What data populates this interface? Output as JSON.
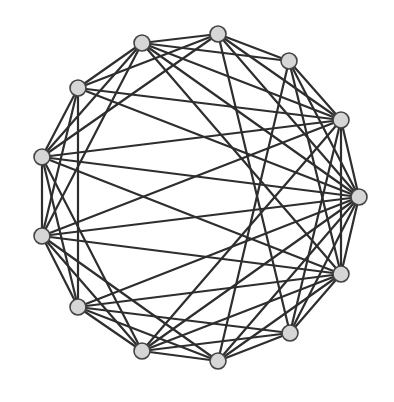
{
  "diagram": {
    "type": "graph",
    "layout": "circular",
    "node_count": 13,
    "colors": {
      "edge": "#2e2e2e",
      "node_fill": "#d6d6d6",
      "node_stroke": "#444444",
      "background": "#ffffff"
    },
    "node_radius": 8,
    "nodes": [
      {
        "id": 0,
        "x": 218,
        "y": 34
      },
      {
        "id": 1,
        "x": 289,
        "y": 61
      },
      {
        "id": 2,
        "x": 341,
        "y": 120
      },
      {
        "id": 3,
        "x": 359,
        "y": 197
      },
      {
        "id": 4,
        "x": 341,
        "y": 274
      },
      {
        "id": 5,
        "x": 290,
        "y": 333
      },
      {
        "id": 6,
        "x": 218,
        "y": 361
      },
      {
        "id": 7,
        "x": 142,
        "y": 351
      },
      {
        "id": 8,
        "x": 78,
        "y": 307
      },
      {
        "id": 9,
        "x": 42,
        "y": 236
      },
      {
        "id": 10,
        "x": 42,
        "y": 157
      },
      {
        "id": 11,
        "x": 78,
        "y": 88
      },
      {
        "id": 12,
        "x": 142,
        "y": 43
      }
    ],
    "edges": [
      [
        0,
        1
      ],
      [
        1,
        2
      ],
      [
        2,
        3
      ],
      [
        3,
        4
      ],
      [
        4,
        5
      ],
      [
        5,
        6
      ],
      [
        6,
        7
      ],
      [
        7,
        8
      ],
      [
        8,
        9
      ],
      [
        9,
        10
      ],
      [
        10,
        11
      ],
      [
        11,
        12
      ],
      [
        12,
        0
      ],
      [
        0,
        2
      ],
      [
        1,
        3
      ],
      [
        2,
        4
      ],
      [
        3,
        5
      ],
      [
        4,
        6
      ],
      [
        5,
        7
      ],
      [
        6,
        8
      ],
      [
        7,
        9
      ],
      [
        8,
        10
      ],
      [
        9,
        11
      ],
      [
        10,
        12
      ],
      [
        11,
        0
      ],
      [
        12,
        1
      ],
      [
        12,
        2
      ],
      [
        0,
        3
      ],
      [
        1,
        4
      ],
      [
        2,
        5
      ],
      [
        3,
        6
      ],
      [
        4,
        7
      ],
      [
        5,
        8
      ],
      [
        6,
        9
      ],
      [
        7,
        10
      ],
      [
        8,
        11
      ],
      [
        9,
        12
      ],
      [
        10,
        0
      ],
      [
        3,
        10
      ],
      [
        3,
        9
      ],
      [
        2,
        10
      ],
      [
        2,
        9
      ],
      [
        4,
        9
      ],
      [
        4,
        10
      ],
      [
        2,
        11
      ],
      [
        4,
        8
      ],
      [
        3,
        11
      ],
      [
        3,
        8
      ],
      [
        2,
        7
      ],
      [
        4,
        12
      ],
      [
        3,
        12
      ],
      [
        3,
        7
      ],
      [
        1,
        6
      ],
      [
        5,
        0
      ]
    ]
  }
}
